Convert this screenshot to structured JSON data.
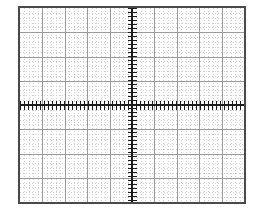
{
  "page": {
    "width": 260,
    "height": 211,
    "background": "#ffffff"
  },
  "graticule": {
    "label": "Oscilloscope graticule",
    "left": 18,
    "top": 6,
    "width": 228,
    "height": 198,
    "border_color": "#4a4a4a",
    "border_width": 2,
    "grid_color": "#9a9a9a",
    "subgrid_color": "#cfcfcf",
    "axis_color": "#1b1b1b",
    "screen_color": "#ffffff"
  },
  "chart_data": {
    "type": "scatter",
    "title": "",
    "subtitle": "",
    "xlabel": "",
    "ylabel": "",
    "grid": true,
    "legend": "none",
    "annotations": [],
    "series": [],
    "x": [],
    "values": [],
    "graticule": {
      "horizontal_divisions": 10,
      "vertical_divisions": 8,
      "subdivisions_per_division": 5,
      "center_axis_x_division": 5,
      "center_axis_y_division": 4,
      "minor_tick_spacing_px": 4,
      "axis_tick_length_px": 9
    },
    "xlim": [
      -5,
      5
    ],
    "ylim": [
      -4,
      4
    ],
    "xticks": [
      -5,
      -4,
      -3,
      -2,
      -1,
      0,
      1,
      2,
      3,
      4,
      5
    ],
    "yticks": [
      -4,
      -3,
      -2,
      -1,
      0,
      1,
      2,
      3,
      4
    ],
    "xticklabels": [
      "",
      "",
      "",
      "",
      "",
      "",
      "",
      "",
      "",
      "",
      ""
    ],
    "yticklabels": [
      "",
      "",
      "",
      "",
      "",
      "",
      "",
      "",
      ""
    ]
  }
}
